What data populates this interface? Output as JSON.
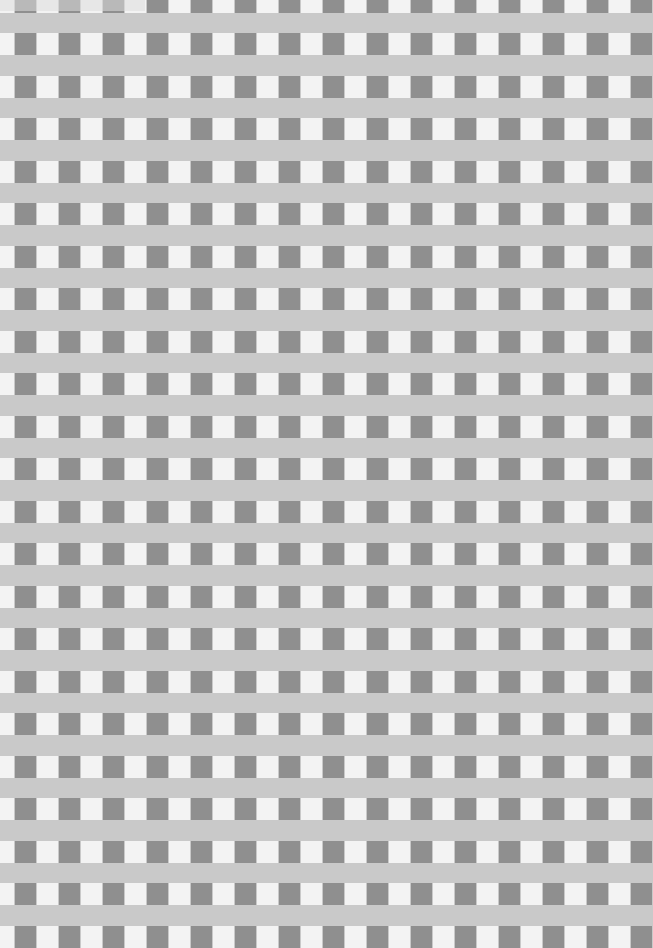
{
  "image": {
    "description": "Gray gingham / checkered fabric-like pattern on paper",
    "width": 653,
    "height": 934
  },
  "pattern": {
    "background_color": "#c9c9c9",
    "dark_square_color": "#8f8f8f",
    "light_square_color": "#f3f3f3",
    "column_period_px": 44,
    "row_period_px": 42.5,
    "first_row_top_px": 33,
    "first_dark_column_left_px": 15,
    "square_width_px": 21,
    "square_height_px": 22,
    "row_count": 22
  },
  "watermark": {
    "text": "",
    "visible": "faint"
  }
}
